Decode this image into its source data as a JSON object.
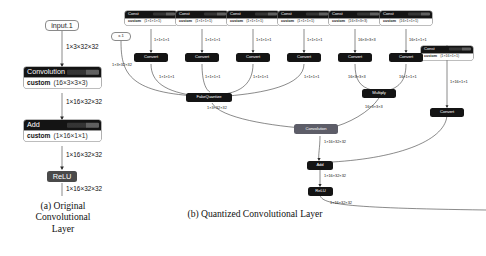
{
  "figure": {
    "panel_a": {
      "caption": "(a) Original Convolutional Layer",
      "caption_lines": [
        "(a) Original",
        "Convolutional",
        "Layer"
      ],
      "nodes": {
        "input": {
          "label": "input.1"
        },
        "conv": {
          "title": "Convolution",
          "param_name": "custom",
          "param_shape": "(16×3×3×3)"
        },
        "add": {
          "title": "Add",
          "param_name": "custom",
          "param_shape": "(1×16×1×1)"
        },
        "relu": {
          "title": "ReLU"
        }
      },
      "edges": {
        "input_to_conv": "1×3×32×32",
        "conv_to_add": "1×16×32×32",
        "add_to_relu": "1×16×32×32",
        "relu_out": "1×16×32×32"
      }
    },
    "panel_b": {
      "caption": "(b) Quantized Convolutional Layer",
      "input": {
        "label": "x.1",
        "out_label": "1×3×32×32"
      },
      "consts": [
        {
          "title": "Const",
          "param_name": "custom",
          "param_shape": "(1×1×1×1)",
          "out_label": "1×1×1×1"
        },
        {
          "title": "Const",
          "param_name": "custom",
          "param_shape": "(1×1×1×1)",
          "out_label": "1×1×1×1"
        },
        {
          "title": "Const",
          "param_name": "custom",
          "param_shape": "(1×1×1×1)",
          "out_label": "1×1×1×1"
        },
        {
          "title": "Const",
          "param_name": "custom",
          "param_shape": "(1×1×1×1)",
          "out_label": "1×1×1×1"
        },
        {
          "title": "Const",
          "param_name": "custom",
          "param_shape": "(16×3×3×3)",
          "out_label": "16×3×3×3"
        },
        {
          "title": "Const",
          "param_name": "custom",
          "param_shape": "(16×1×1×1)",
          "out_label": "16×1×1×1"
        },
        {
          "title": "Const",
          "param_name": "custom",
          "param_shape": "(1×16×1×1)",
          "out_label": "1×16×1×1"
        }
      ],
      "converts": [
        {
          "label": "Convert",
          "out_label": "1×1×1×1"
        },
        {
          "label": "Convert",
          "out_label": "1×1×1×1"
        },
        {
          "label": "Convert",
          "out_label": "1×1×1×1"
        },
        {
          "label": "Convert",
          "out_label": "1×1×1×1"
        },
        {
          "label": "Convert",
          "out_label": "16×3×3×3"
        },
        {
          "label": "Convert",
          "out_label": "16×1×1×1"
        },
        {
          "label": "Convert",
          "out_label": "1×16×1×1"
        }
      ],
      "ops": {
        "fakequantize": {
          "label": "FakeQuantize",
          "out_label": "1×3×32×32"
        },
        "multiply": {
          "label": "Multiply",
          "out_label": "16×3×3×3"
        },
        "convolution": {
          "label": "Convolution",
          "out_label": "1×16×32×32"
        },
        "add": {
          "label": "Add",
          "out_label": "1×16×32×32"
        },
        "relu": {
          "label": "ReLU",
          "out_label": "1×16×32×32"
        }
      }
    }
  },
  "colors": {
    "node_dark": "#141414",
    "node_gray": "#5d5d68",
    "edge": "#2b2b2b",
    "text_light": "#ffffff",
    "text_dark": "#111111",
    "background": "#ffffff"
  }
}
